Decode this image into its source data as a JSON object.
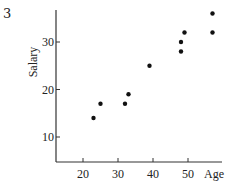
{
  "figure": {
    "number": "3"
  },
  "chart_data": {
    "type": "scatter",
    "title": "",
    "xlabel": "Age",
    "ylabel": "Salary",
    "x_ticks": [
      20,
      30,
      40,
      50
    ],
    "y_ticks": [
      10,
      20,
      30
    ],
    "xlim": [
      12,
      59
    ],
    "ylim": [
      5,
      37
    ],
    "grid": false,
    "legend": null,
    "series": [
      {
        "name": "Employees",
        "color": "#111111",
        "points": [
          {
            "x": 23,
            "y": 14
          },
          {
            "x": 25,
            "y": 17
          },
          {
            "x": 32,
            "y": 17
          },
          {
            "x": 33,
            "y": 19
          },
          {
            "x": 39,
            "y": 25
          },
          {
            "x": 48,
            "y": 28
          },
          {
            "x": 48,
            "y": 30
          },
          {
            "x": 49,
            "y": 32
          },
          {
            "x": 57,
            "y": 32
          },
          {
            "x": 57,
            "y": 36
          }
        ]
      }
    ]
  }
}
